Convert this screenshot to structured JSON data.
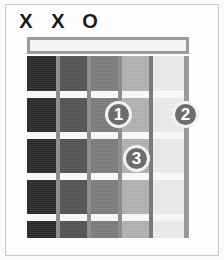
{
  "diagram": {
    "type": "guitar-chord-diagram",
    "string_count": 6,
    "fret_count": 5
  },
  "string_markers": [
    {
      "id": "string-1-marker",
      "symbol": "X",
      "meaning": "muted"
    },
    {
      "id": "string-2-marker",
      "symbol": "X",
      "meaning": "muted"
    },
    {
      "id": "string-3-marker",
      "symbol": "O",
      "meaning": "open"
    }
  ],
  "finger_positions": [
    {
      "label": "1",
      "string": 4,
      "fret": 2
    },
    {
      "label": "2",
      "string": 6,
      "fret": 2
    },
    {
      "label": "3",
      "string": 5,
      "fret": 3
    }
  ],
  "colors": {
    "nut": "#f4f4f4",
    "nut_border": "#9a9a9a",
    "fret_line": "#f7f7f7",
    "string_line": "#8e8e8e",
    "dot_fill": "#6d6d6d",
    "dot_text": "#ffffff",
    "marker_text": "#1b1b1b",
    "card_background": "#fdfdfd",
    "frame_border": "#c9c9c9"
  }
}
